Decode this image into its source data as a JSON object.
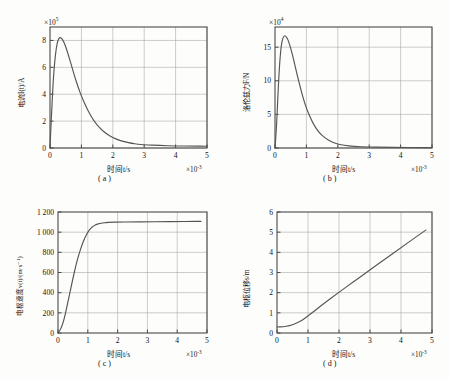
{
  "figure": {
    "background": "#fdfdfc",
    "axis_color": "#4a4a4a",
    "grid_color": "#9a9a9a",
    "curve_color": "#555555"
  },
  "panels": [
    {
      "id": "a",
      "caption": "( a )",
      "ylabel": "电流I(t)/A",
      "xlabel": "时间t/s",
      "y_exponent": "×10",
      "y_exponent_sup": "5",
      "x_exponent": "×10",
      "x_exponent_sup": "-3",
      "yticks": [
        "0",
        "2",
        "4",
        "6",
        "8"
      ],
      "xticks": [
        "0",
        "1",
        "2",
        "3",
        "4",
        "5"
      ]
    },
    {
      "id": "b",
      "caption": "( b )",
      "ylabel": "洛伦兹力F/N",
      "xlabel": "时间t/s",
      "y_exponent": "×10",
      "y_exponent_sup": "4",
      "x_exponent": "×10",
      "x_exponent_sup": "-3",
      "yticks": [
        "0",
        "5",
        "10",
        "15"
      ],
      "xticks": [
        "0",
        "1",
        "2",
        "3",
        "4",
        "5"
      ]
    },
    {
      "id": "c",
      "caption": "( c )",
      "ylabel": "电枢速度v(t)/(m·s⁻¹)",
      "xlabel": "时间t/s",
      "y_exponent": "",
      "y_exponent_sup": "",
      "x_exponent": "×10",
      "x_exponent_sup": "-3",
      "yticks": [
        "0",
        "200",
        "400",
        "600",
        "800",
        "1 000",
        "1 200"
      ],
      "xticks": [
        "0",
        "1",
        "2",
        "3",
        "4",
        "5"
      ]
    },
    {
      "id": "d",
      "caption": "( d )",
      "ylabel": "电枢位移s/m",
      "xlabel": "时间t/s",
      "y_exponent": "",
      "y_exponent_sup": "",
      "x_exponent": "×10",
      "x_exponent_sup": "-3",
      "yticks": [
        "0",
        "1",
        "2",
        "3",
        "4",
        "5",
        "6"
      ],
      "xticks": [
        "0",
        "1",
        "2",
        "3",
        "4",
        "5"
      ]
    }
  ],
  "chart_data": [
    {
      "type": "line",
      "panel": "a",
      "title": "( a )",
      "xlabel": "时间t/s",
      "ylabel": "电流I(t)/A",
      "x_scale": 0.001,
      "y_scale": 100000.0,
      "xlim": [
        0,
        5
      ],
      "ylim": [
        0,
        9
      ],
      "xticks": [
        0,
        1,
        2,
        3,
        4,
        5
      ],
      "yticks": [
        0,
        2,
        4,
        6,
        8
      ],
      "grid": true,
      "legend": "none",
      "x": [
        0.0,
        0.05,
        0.1,
        0.15,
        0.2,
        0.25,
        0.3,
        0.33,
        0.4,
        0.5,
        0.6,
        0.7,
        0.8,
        0.9,
        1.0,
        1.2,
        1.4,
        1.6,
        1.8,
        2.0,
        2.2,
        2.4,
        2.6,
        2.8,
        3.0,
        3.5,
        4.0,
        4.5,
        5.0
      ],
      "y": [
        0.0,
        2.6,
        4.9,
        6.45,
        7.45,
        8.0,
        8.2,
        8.22,
        8.1,
        7.55,
        6.8,
        6.0,
        5.2,
        4.5,
        3.85,
        2.8,
        2.0,
        1.45,
        1.05,
        0.78,
        0.58,
        0.45,
        0.35,
        0.28,
        0.24,
        0.18,
        0.15,
        0.14,
        0.13
      ]
    },
    {
      "type": "line",
      "panel": "b",
      "title": "( b )",
      "xlabel": "时间t/s",
      "ylabel": "洛伦兹力F/N",
      "x_scale": 0.001,
      "y_scale": 10000.0,
      "xlim": [
        0,
        5
      ],
      "ylim": [
        0,
        18
      ],
      "xticks": [
        0,
        1,
        2,
        3,
        4,
        5
      ],
      "yticks": [
        0,
        5,
        10,
        15
      ],
      "grid": true,
      "legend": "none",
      "x": [
        0.0,
        0.05,
        0.1,
        0.15,
        0.2,
        0.25,
        0.3,
        0.33,
        0.4,
        0.5,
        0.6,
        0.7,
        0.8,
        0.9,
        1.0,
        1.2,
        1.4,
        1.6,
        1.8,
        2.0,
        2.2,
        2.5,
        3.0,
        3.5,
        4.0,
        4.5,
        5.0
      ],
      "y": [
        0.0,
        3.2,
        8.6,
        12.8,
        15.3,
        16.4,
        16.7,
        16.7,
        16.3,
        14.9,
        13.0,
        11.0,
        9.1,
        7.4,
        5.9,
        3.7,
        2.3,
        1.45,
        0.9,
        0.58,
        0.4,
        0.24,
        0.14,
        0.1,
        0.08,
        0.07,
        0.06
      ]
    },
    {
      "type": "line",
      "panel": "c",
      "title": "( c )",
      "xlabel": "时间t/s",
      "ylabel": "电枢速度v(t)/(m·s⁻¹)",
      "x_scale": 0.001,
      "y_scale": 1,
      "xlim": [
        0,
        5
      ],
      "ylim": [
        0,
        1200
      ],
      "xticks": [
        0,
        1,
        2,
        3,
        4,
        5
      ],
      "yticks": [
        0,
        200,
        400,
        600,
        800,
        1000,
        1200
      ],
      "grid": true,
      "legend": "none",
      "x": [
        0.0,
        0.1,
        0.2,
        0.3,
        0.4,
        0.5,
        0.6,
        0.7,
        0.8,
        0.9,
        1.0,
        1.1,
        1.2,
        1.3,
        1.4,
        1.5,
        1.6,
        1.8,
        2.0,
        2.5,
        3.0,
        3.5,
        4.0,
        4.5,
        4.8
      ],
      "y": [
        0,
        40,
        130,
        260,
        400,
        540,
        670,
        780,
        870,
        945,
        1000,
        1040,
        1062,
        1078,
        1086,
        1092,
        1095,
        1098,
        1100,
        1102,
        1103,
        1104,
        1105,
        1106,
        1107
      ]
    },
    {
      "type": "line",
      "panel": "d",
      "title": "( d )",
      "xlabel": "时间t/s",
      "ylabel": "电枢位移s/m",
      "x_scale": 0.001,
      "y_scale": 1,
      "xlim": [
        0,
        5
      ],
      "ylim": [
        0,
        6
      ],
      "xticks": [
        0,
        1,
        2,
        3,
        4,
        5
      ],
      "yticks": [
        0,
        1,
        2,
        3,
        4,
        5,
        6
      ],
      "grid": true,
      "legend": "none",
      "x": [
        0.0,
        0.2,
        0.4,
        0.6,
        0.8,
        1.0,
        1.2,
        1.5,
        2.0,
        2.5,
        3.0,
        3.5,
        4.0,
        4.5,
        4.8
      ],
      "y": [
        0.3,
        0.31,
        0.36,
        0.46,
        0.62,
        0.85,
        1.08,
        1.45,
        2.02,
        2.58,
        3.13,
        3.68,
        4.23,
        4.78,
        5.1
      ]
    }
  ]
}
